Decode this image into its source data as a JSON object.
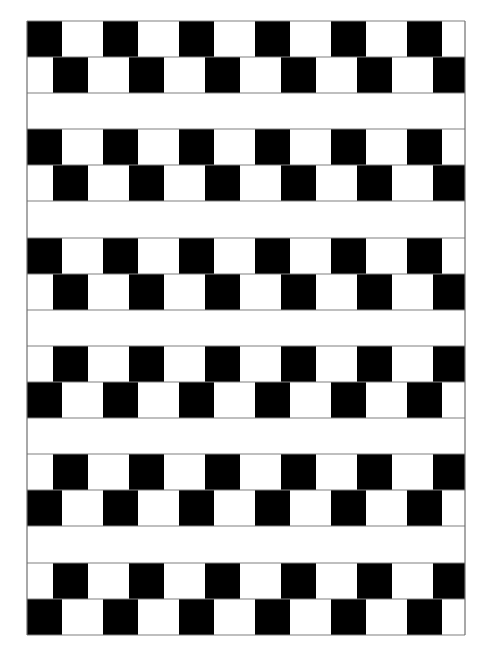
{
  "figure": {
    "colors": {
      "background": "#ffffff",
      "tile": "#000000",
      "mortar": "#808080",
      "frame": "#6e6e6e"
    },
    "frame": {
      "left": 27,
      "top": 21,
      "right": 465,
      "bottom": 635
    },
    "tile_size": {
      "width": 35,
      "height": 36
    },
    "column_period": 76,
    "columns": 6,
    "pairs": [
      {
        "y": 21,
        "upper_offset": 27,
        "lower_offset": 53
      },
      {
        "y": 129,
        "upper_offset": 27,
        "lower_offset": 53
      },
      {
        "y": 238,
        "upper_offset": 27,
        "lower_offset": 53
      },
      {
        "y": 346,
        "upper_offset": 53,
        "lower_offset": 27
      },
      {
        "y": 454,
        "upper_offset": 53,
        "lower_offset": 27
      },
      {
        "y": 563,
        "upper_offset": 53,
        "lower_offset": 27
      }
    ]
  }
}
